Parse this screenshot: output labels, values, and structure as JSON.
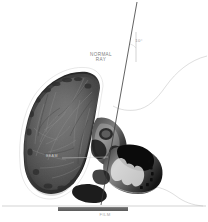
{
  "figure": {
    "type": "lateral-skull-radiograph-diagram",
    "background_color": "#ffffff"
  },
  "annotations": {
    "normal_ray_label": "NORMAL\nRAY",
    "angle_label": "10°",
    "film_label": "FILM",
    "beam_label": "BEAM"
  },
  "colors": {
    "ray_line": "#3a3a3a",
    "vertical_reference": "#b9b9b9",
    "profile_outline": "#bdbdbd",
    "baseline": "#b5b5b5",
    "film_bar": "#6f6f6f",
    "skull_outline": "#ffffff",
    "bone_dark": "#1c1c1c",
    "bone_mid": "#555555",
    "bone_light": "#9a9a9a"
  },
  "geometry": {
    "ray_top": [
      137,
      2
    ],
    "ray_bottom": [
      101,
      205
    ],
    "vertical_line_x": 136,
    "vertical_top": 32,
    "vertical_bottom": 62,
    "baseline_y": 206,
    "film_bar": {
      "x": 58,
      "y": 207,
      "width": 70,
      "height": 4
    }
  }
}
